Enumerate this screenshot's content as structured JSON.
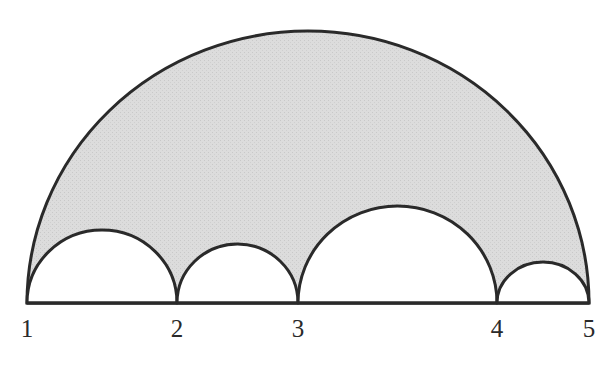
{
  "diagram": {
    "type": "arbelos-style semicircles on a line",
    "baseline_y": 303,
    "points": [
      {
        "label": "1",
        "x": 27
      },
      {
        "label": "2",
        "x": 177
      },
      {
        "label": "3",
        "x": 298
      },
      {
        "label": "4",
        "x": 497
      },
      {
        "label": "5",
        "x": 589
      }
    ],
    "outer_arc": {
      "from": "1",
      "to": "5",
      "peak_y": 31
    },
    "inner_arcs": [
      {
        "from": "1",
        "to": "2",
        "peak_y": 230
      },
      {
        "from": "2",
        "to": "3",
        "peak_y": 244
      },
      {
        "from": "3",
        "to": "4",
        "peak_y": 206
      },
      {
        "from": "4",
        "to": "5",
        "peak_y": 262
      }
    ],
    "colors": {
      "shaded_region": "#dcdcdc",
      "stroke": "#2a2a2a",
      "inner_fill": "#ffffff"
    }
  }
}
